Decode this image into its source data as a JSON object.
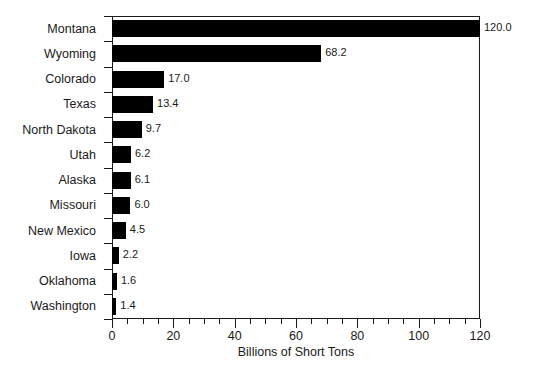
{
  "chart_data": {
    "type": "bar",
    "orientation": "horizontal",
    "title": "",
    "xlabel": "Billions of Short Tons",
    "ylabel": "",
    "xlim": [
      0,
      120
    ],
    "xticks": [
      0,
      20,
      40,
      60,
      80,
      100,
      120
    ],
    "xtick_labels": [
      "0",
      "20",
      "40",
      "60",
      "80",
      "100",
      "120"
    ],
    "minor_tick_interval": 5,
    "grid": false,
    "legend": null,
    "bar_color": "#000000",
    "frame_color": "#1a1a1a",
    "categories": [
      "Montana",
      "Wyoming",
      "Colorado",
      "Texas",
      "North Dakota",
      "Utah",
      "Alaska",
      "Missouri",
      "New Mexico",
      "Iowa",
      "Oklahoma",
      "Washington"
    ],
    "values": [
      120.0,
      68.2,
      17.0,
      13.4,
      9.7,
      6.2,
      6.1,
      6.0,
      4.5,
      2.2,
      1.6,
      1.4
    ],
    "data_labels": [
      "120.0",
      "68.2",
      "17.0",
      "13.4",
      "9.7",
      "6.2",
      "6.1",
      "6.0",
      "4.5",
      "2.2",
      "1.6",
      "1.4"
    ]
  }
}
